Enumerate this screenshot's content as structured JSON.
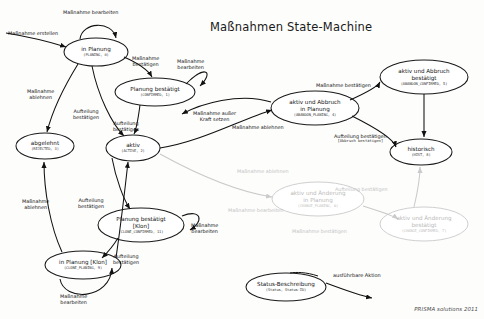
{
  "diagram": {
    "title": "Maßnahmen State-Machine",
    "footer": "PRISMA solutions 2011",
    "colors": {
      "node_stroke": "#1a1a1a",
      "node_fill": "#ffffff",
      "edge": "#111111",
      "dim": "#c9c9c9",
      "text": "#111111"
    }
  },
  "nodes": [
    {
      "id": "in_planung",
      "title": "in Planung",
      "code": "(PLANING, 0)",
      "cx": 96,
      "cy": 52,
      "rx": 32,
      "ry": 14,
      "dim": false
    },
    {
      "id": "planung_bestaetigt",
      "title": "Planung bestätigt",
      "code": "(CONFIRMED, 1)",
      "cx": 155,
      "cy": 92,
      "rx": 40,
      "ry": 14,
      "dim": false
    },
    {
      "id": "abgelehnt",
      "title": "abgelehnt",
      "code": "(REJECTED, 3)",
      "cx": 45,
      "cy": 146,
      "rx": 29,
      "ry": 13,
      "dim": false
    },
    {
      "id": "aktiv",
      "title": "aktiv",
      "code": "(ACTIVE, 2)",
      "cx": 133,
      "cy": 148,
      "rx": 27,
      "ry": 13,
      "dim": false
    },
    {
      "id": "aktiv_abbruch_pl",
      "title": "aktiv und Abbruch\nin Planung",
      "code": "(ABANDON_PLANING, 4)",
      "cx": 315,
      "cy": 108,
      "rx": 44,
      "ry": 17,
      "dim": false
    },
    {
      "id": "aktiv_abbruch_best",
      "title": "aktiv und Abbruch\nbestätigt",
      "code": "(ABANDON_CONFIRMED, 5)",
      "cx": 424,
      "cy": 77,
      "rx": 44,
      "ry": 17,
      "dim": false
    },
    {
      "id": "historisch",
      "title": "historisch",
      "code": "(HIST, 8)",
      "cx": 421,
      "cy": 152,
      "rx": 31,
      "ry": 13,
      "dim": false
    },
    {
      "id": "aktiv_aend_pl",
      "title": "aktiv und Änderung\nin Planung",
      "code": "(CHANGE_PLANING, 6)",
      "cx": 318,
      "cy": 199,
      "rx": 46,
      "ry": 17,
      "dim": true
    },
    {
      "id": "aktiv_aend_best",
      "title": "aktiv und Änderung\nbestätigt",
      "code": "(CHANGE_CONFIRMED, 7)",
      "cx": 424,
      "cy": 224,
      "rx": 44,
      "ry": 17,
      "dim": true
    },
    {
      "id": "planung_best_klon",
      "title": "Planung bestätigt\n[Klon]",
      "code": "(CLONE_CONFIRMED, 11)",
      "cx": 141,
      "cy": 225,
      "rx": 43,
      "ry": 17,
      "dim": false
    },
    {
      "id": "in_planung_klon",
      "title": "in Planung [Klon]",
      "code": "(CLONE_PLANING, 9)",
      "cx": 83,
      "cy": 265,
      "rx": 38,
      "ry": 14,
      "dim": false
    }
  ],
  "edge_labels": [
    {
      "id": "massnahme_erstellen",
      "text": "Maßnahme erstellen",
      "x": 8,
      "y": 30,
      "dim": false
    },
    {
      "id": "massnahme_bearbeiten_1",
      "text": "Maßnahme bearbeiten",
      "x": 63,
      "y": 9,
      "dim": false
    },
    {
      "id": "massnahme_bestaetigen_1",
      "text": "Maßnahme\nbestätigen",
      "x": 132,
      "y": 55,
      "dim": false
    },
    {
      "id": "massnahme_bearbeiten_2",
      "text": "Maßnahme\nbearbeiten",
      "x": 177,
      "y": 58,
      "dim": false
    },
    {
      "id": "massnahme_ablehnen_1",
      "text": "Maßnahme\nablehnen",
      "x": 27,
      "y": 88,
      "dim": false
    },
    {
      "id": "aufteilung_bestaetigen_1",
      "text": "Aufteilung\nbestätigen",
      "x": 73,
      "y": 108,
      "dim": false
    },
    {
      "id": "aufteilung_bestaetigen_2",
      "text": "Aufteilung\nbestätigen",
      "x": 113,
      "y": 120,
      "dim": false
    },
    {
      "id": "massnahme_ausser_kraft",
      "text": "Maßnahme außer\nKraft setzen",
      "x": 193,
      "y": 110,
      "dim": false
    },
    {
      "id": "massnahme_bestaetigen_2",
      "text": "Maßnahme bestätigen",
      "x": 316,
      "y": 82,
      "dim": false
    },
    {
      "id": "massnahme_ablehnen_2",
      "text": "Maßnahme ablehnen",
      "x": 232,
      "y": 124,
      "dim": false
    },
    {
      "id": "aufteilung_bestaetigen_3",
      "text": "Aufteilung bestätigen",
      "sub": "[Abbruch bestätigen]",
      "x": 334,
      "y": 133,
      "dim": false
    },
    {
      "id": "massnahme_ablehnen_3",
      "text": "Maßnahme ablehnen",
      "x": 237,
      "y": 168,
      "dim": true
    },
    {
      "id": "aufteilung_bestaetigen_4",
      "text": "Aufteilung bestätigen",
      "x": 335,
      "y": 186,
      "dim": true
    },
    {
      "id": "massnahme_bearbeiten_3",
      "text": "Maßnahme bearbeiten",
      "x": 228,
      "y": 207,
      "dim": true
    },
    {
      "id": "massnahme_bestaetigen_3",
      "text": "Maßnahme bestätigen",
      "x": 292,
      "y": 228,
      "dim": true
    },
    {
      "id": "aufteilung_bestaetigen_5",
      "text": "Aufteilung\nbestätigen",
      "x": 78,
      "y": 197,
      "dim": false
    },
    {
      "id": "massnahme_bearbeiten_4",
      "text": "Maßnahme\nbearbeiten",
      "x": 191,
      "y": 222,
      "dim": false
    },
    {
      "id": "aufteilung_bestaetigen_6",
      "text": "Aufteilung\nbestätigen",
      "x": 113,
      "y": 253,
      "dim": false
    },
    {
      "id": "massnahme_ablehnen_4",
      "text": "Maßnahme\nablehnen",
      "x": 22,
      "y": 198,
      "dim": false
    },
    {
      "id": "massnahme_bearbeiten_5",
      "text": "Maßnahme\nbearbeiten",
      "x": 60,
      "y": 293,
      "dim": false
    }
  ],
  "legend": {
    "status_node": {
      "title": "Status-Beschreibung",
      "code": "(Status, Status-ID)",
      "cx": 286,
      "cy": 287,
      "rx": 40,
      "ry": 14
    },
    "action_label": {
      "text": "ausführbare Aktion",
      "x": 333,
      "y": 272
    }
  }
}
